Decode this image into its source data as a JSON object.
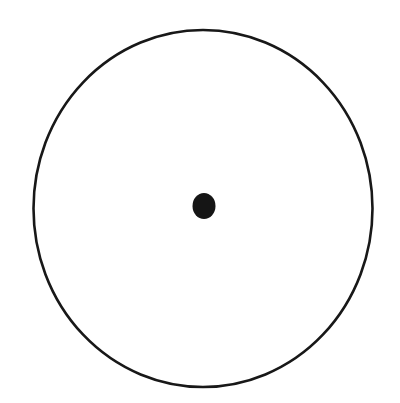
{
  "canvas": {
    "width": 400,
    "height": 403,
    "background_color": "#ffffff"
  },
  "figure": {
    "name": "circle-with-center-dot",
    "text_content": "",
    "labels": [],
    "annotations": []
  },
  "shapes": {
    "outer_circle": {
      "name": "outer-circle",
      "type": "ellipse",
      "center_x": 203,
      "center_y": 208.5,
      "radius_x": 169.5,
      "radius_y": 178.5,
      "stroke_color": "#181818",
      "stroke_width": 2.6,
      "fill": "none"
    },
    "center_dot": {
      "name": "center-dot",
      "type": "ellipse",
      "center_x": 204,
      "center_y": 206,
      "radius_x": 11.5,
      "radius_y": 13,
      "fill_color": "#151515",
      "stroke_color": "#151515",
      "stroke_width": 0
    }
  }
}
